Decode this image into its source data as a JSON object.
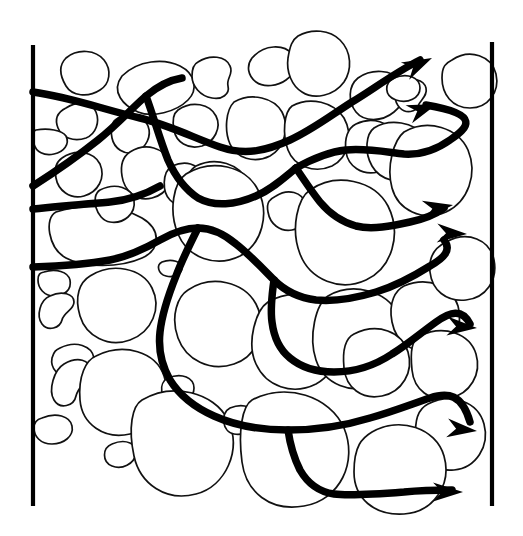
{
  "figure": {
    "domain": "Diagram",
    "canvas": {
      "width": 523,
      "height": 536,
      "background": "#ffffff"
    }
  },
  "style": {
    "grain_outline_color": "#111111",
    "grain_fill_color": "#ffffff",
    "flow_path_color": "#000000",
    "boundary_color": "#000000",
    "grain_stroke_width": 1.7,
    "flow_stroke_width": 7.5,
    "boundary_stroke_width": 4.2
  },
  "boundaries": [
    {
      "name": "inlet-boundary-left",
      "x1": 33,
      "y1": 45,
      "x2": 33,
      "y2": 506
    },
    {
      "name": "outlet-boundary-right",
      "x1": 492,
      "y1": 42,
      "x2": 492,
      "y2": 506
    }
  ],
  "flow": {
    "inlet_count": 4,
    "outlet_count": 7,
    "inlet_points": [
      {
        "label": "inlet-1",
        "x": 33,
        "y": 92
      },
      {
        "label": "inlet-2",
        "x": 33,
        "y": 186
      },
      {
        "label": "inlet-3",
        "x": 33,
        "y": 209
      },
      {
        "label": "inlet-4",
        "x": 33,
        "y": 267
      }
    ],
    "outlet_points": [
      {
        "label": "outlet-1",
        "x": 432,
        "y": 58
      },
      {
        "label": "outlet-2",
        "x": 436,
        "y": 104
      },
      {
        "label": "outlet-3",
        "x": 452,
        "y": 205
      },
      {
        "label": "outlet-4",
        "x": 466,
        "y": 234
      },
      {
        "label": "outlet-5",
        "x": 476,
        "y": 327
      },
      {
        "label": "outlet-6",
        "x": 476,
        "y": 430
      },
      {
        "label": "outlet-7",
        "x": 462,
        "y": 492
      }
    ],
    "paths": [
      {
        "name": "flow-path-1",
        "d": "M 33 92 C 70 97 105 110 140 118 C 172 126 196 139 220 147 C 246 156 268 150 290 140 C 312 130 330 116 352 102 C 372 90 396 72 420 60"
      },
      {
        "name": "flow-path-2",
        "d": "M 33 186 C 58 170 78 156 98 140 C 118 124 132 108 146 96 C 158 86 170 80 182 78"
      },
      {
        "name": "flow-path-3",
        "d": "M 146 96 C 154 118 160 140 168 160 C 176 178 186 190 198 198 C 214 207 236 205 256 196 C 272 189 284 178 296 168"
      },
      {
        "name": "flow-path-4",
        "d": "M 296 168 C 312 159 328 152 346 150 C 366 148 386 152 404 154 C 420 155 436 150 450 140 C 468 128 482 114 426 105"
      },
      {
        "name": "flow-path-5",
        "d": "M 296 168 C 304 180 312 192 320 202 C 330 214 342 222 356 226 C 372 230 392 226 410 222 C 424 219 436 214 444 208"
      },
      {
        "name": "flow-path-6",
        "d": "M 33 209 C 60 206 86 204 110 202 C 130 200 146 194 160 186"
      },
      {
        "name": "flow-path-7",
        "d": "M 33 267 C 62 266 88 264 110 260 C 130 256 146 248 160 240 C 174 232 186 228 198 228 C 212 228 224 234 236 244 C 250 255 262 268 274 280 C 286 292 300 298 316 300 C 336 302 356 298 376 292 C 396 286 414 276 430 266 C 444 258 452 250 444 240"
      },
      {
        "name": "flow-path-8",
        "d": "M 274 280 C 272 294 270 308 272 322 C 274 338 280 350 290 358 C 302 368 318 372 334 372 C 354 372 374 366 392 354 C 408 344 422 332 436 322 C 450 312 462 308 470 324"
      },
      {
        "name": "flow-path-9",
        "d": "M 198 228 C 190 244 182 260 176 276 C 168 296 162 314 160 332 C 158 350 162 366 170 380 C 180 396 196 408 214 416 C 236 426 262 430 288 430 C 316 430 344 426 370 418 C 392 412 412 404 430 398 C 448 392 462 394 470 422"
      },
      {
        "name": "flow-path-10",
        "d": "M 288 430 C 290 444 294 458 300 470 C 308 484 320 492 334 494 C 350 496 378 494 404 492 C 424 490 440 490 452 490"
      }
    ],
    "arrowheads": [
      {
        "name": "arrowhead-1",
        "tip_x": 432,
        "tip_y": 58,
        "angle": -26
      },
      {
        "name": "arrowhead-2",
        "tip_x": 437,
        "tip_y": 104,
        "angle": -20
      },
      {
        "name": "arrowhead-3",
        "tip_x": 453,
        "tip_y": 205,
        "angle": -10
      },
      {
        "name": "arrowhead-4",
        "tip_x": 467,
        "tip_y": 234,
        "angle": 2
      },
      {
        "name": "arrowhead-5",
        "tip_x": 477,
        "tip_y": 328,
        "angle": 4
      },
      {
        "name": "arrowhead-6",
        "tip_x": 477,
        "tip_y": 431,
        "angle": 6
      },
      {
        "name": "arrowhead-7",
        "tip_x": 463,
        "tip_y": 492,
        "angle": 0
      }
    ]
  },
  "grains": [
    {
      "name": "grain-1",
      "d": "M 66 58 C 78 48 96 50 104 60 C 112 70 110 84 100 90 C 88 98 72 96 66 86 C 60 76 58 66 66 58 Z"
    },
    {
      "name": "grain-2",
      "d": "M 122 76 C 138 60 164 58 180 66 C 196 74 198 90 188 100 C 176 112 152 118 138 112 C 124 106 110 92 122 76 Z"
    },
    {
      "name": "grain-3",
      "d": "M 198 62 C 210 54 226 56 230 66 C 234 74 226 78 228 86 C 230 94 222 100 212 98 C 200 96 192 86 192 76 C 192 68 194 64 198 62 Z"
    },
    {
      "name": "grain-4",
      "d": "M 252 58 C 264 44 284 44 292 54 C 300 64 294 74 286 80 C 278 86 264 88 256 82 C 248 76 246 66 252 58 Z"
    },
    {
      "name": "grain-5",
      "d": "M 298 36 C 312 28 330 30 340 40 C 352 52 352 70 344 82 C 334 96 314 100 302 92 C 292 86 286 72 288 58 C 290 46 292 40 298 36 Z"
    },
    {
      "name": "grain-6",
      "d": "M 358 78 C 372 68 392 70 400 80 C 408 90 404 104 394 112 C 382 122 364 122 356 112 C 348 102 348 86 358 78 Z"
    },
    {
      "name": "grain-7",
      "d": "M 400 82 C 412 76 424 80 426 88 C 428 96 420 100 418 106 C 416 112 406 114 400 108 C 394 102 392 88 400 82 Z"
    },
    {
      "name": "grain-8",
      "d": "M 66 108 C 78 100 92 102 96 112 C 100 122 96 134 86 138 C 74 142 62 138 58 128 C 54 118 58 112 66 108 Z"
    },
    {
      "name": "grain-9",
      "d": "M 36 130 C 48 128 62 130 66 136 C 70 144 64 152 54 154 C 44 156 36 152 34 144 C 32 136 32 131 36 130 Z"
    },
    {
      "name": "grain-10",
      "d": "M 118 118 C 130 112 144 116 148 126 C 152 136 146 148 136 152 C 124 156 114 148 112 138 C 110 128 112 121 118 118 Z"
    },
    {
      "name": "grain-11",
      "d": "M 178 110 C 192 100 210 104 216 116 C 222 128 214 142 202 146 C 188 150 176 142 174 130 C 172 120 174 113 178 110 Z"
    },
    {
      "name": "grain-12",
      "d": "M 234 102 C 252 92 274 98 282 112 C 290 128 284 148 270 156 C 254 164 236 158 230 144 C 224 130 226 110 234 102 Z"
    },
    {
      "name": "grain-13",
      "d": "M 292 106 C 310 96 334 102 344 118 C 354 136 348 158 332 166 C 314 174 294 166 288 150 C 282 134 284 112 292 106 Z"
    },
    {
      "name": "grain-14",
      "d": "M 356 124 C 372 116 390 122 396 136 C 402 152 394 168 378 172 C 362 176 348 166 346 152 C 344 138 348 128 356 124 Z"
    },
    {
      "name": "grain-15",
      "d": "M 374 128 C 390 118 414 122 424 136 C 434 150 430 168 416 176 C 400 186 380 180 372 166 C 364 152 366 134 374 128 Z"
    },
    {
      "name": "grain-16",
      "d": "M 62 158 C 76 148 94 152 100 164 C 106 178 98 192 84 196 C 70 200 58 190 56 178 C 54 168 56 162 62 158 Z"
    },
    {
      "name": "grain-17",
      "d": "M 130 152 C 146 142 164 148 170 162 C 176 178 168 194 152 198 C 136 202 124 190 122 176 C 120 164 124 156 130 152 Z"
    },
    {
      "name": "grain-18",
      "d": "M 172 166 C 186 160 198 164 200 174 C 202 184 194 190 192 198 C 190 206 178 208 170 200 C 162 192 162 172 172 166 Z"
    },
    {
      "name": "grain-19",
      "d": "M 196 166 C 216 156 240 164 248 182 C 256 202 248 224 230 232 C 210 240 190 230 184 212 C 178 194 186 172 196 166 Z"
    },
    {
      "name": "grain-20",
      "d": "M 276 196 C 288 188 302 192 306 204 C 310 216 304 228 292 230 C 280 232 270 224 268 212 C 266 202 270 199 276 196 Z"
    },
    {
      "name": "grain-21",
      "d": "M 186 174 C 212 158 246 166 258 190 C 270 214 262 244 240 256 C 216 268 188 258 178 234 C 168 210 174 182 186 174 Z"
    },
    {
      "name": "grain-22",
      "d": "M 310 190 C 336 172 374 180 388 206 C 402 234 392 268 366 280 C 340 292 310 280 300 254 C 290 228 298 198 310 190 Z"
    },
    {
      "name": "grain-23",
      "d": "M 404 132 C 428 118 458 128 468 150 C 478 174 468 202 446 212 C 422 222 398 210 392 188 C 386 166 394 140 404 132 Z"
    },
    {
      "name": "grain-24",
      "d": "M 56 212 C 84 202 122 206 142 218 C 162 230 160 250 142 258 C 120 268 84 268 66 258 C 48 248 44 218 56 212 Z"
    },
    {
      "name": "grain-25",
      "d": "M 162 262 C 172 258 182 262 182 268 C 182 274 174 278 166 276 C 158 274 156 265 162 262 Z"
    },
    {
      "name": "grain-26",
      "d": "M 90 276 C 112 262 142 268 152 288 C 162 308 152 332 130 340 C 108 348 86 336 80 316 C 74 296 80 282 90 276 Z"
    },
    {
      "name": "grain-27",
      "d": "M 44 272 C 56 268 68 272 70 280 C 72 290 64 296 54 296 C 44 296 38 288 38 280 C 38 274 40 273 44 272 Z"
    },
    {
      "name": "grain-28",
      "d": "M 188 290 C 212 274 244 282 256 304 C 268 328 258 356 234 364 C 210 372 186 360 178 338 C 170 316 178 296 188 290 Z"
    },
    {
      "name": "grain-29",
      "d": "M 268 302 C 292 288 322 294 334 316 C 346 340 338 372 316 384 C 292 396 266 386 256 364 C 246 342 256 310 268 302 Z"
    },
    {
      "name": "grain-30",
      "d": "M 328 296 C 352 282 386 290 398 314 C 410 340 400 372 376 384 C 352 396 324 384 316 360 C 308 336 316 304 328 296 Z"
    },
    {
      "name": "grain-31",
      "d": "M 404 286 C 428 276 452 286 458 306 C 464 326 452 346 432 350 C 412 354 396 342 392 322 C 388 302 396 290 404 286 Z"
    },
    {
      "name": "grain-32",
      "d": "M 446 242 C 468 230 490 240 494 260 C 498 280 486 298 466 300 C 446 302 432 290 430 272 C 428 254 438 246 446 242 Z"
    },
    {
      "name": "grain-33",
      "d": "M 50 296 C 62 290 74 294 74 302 C 74 310 64 312 62 320 C 60 328 48 332 42 324 C 36 316 40 300 50 296 Z"
    },
    {
      "name": "grain-34",
      "d": "M 60 348 C 76 340 92 346 94 358 C 96 370 86 378 72 378 C 58 378 50 368 52 358 C 54 351 56 350 60 348 Z"
    },
    {
      "name": "grain-35",
      "d": "M 64 364 C 78 356 90 360 90 370 C 90 380 78 386 76 396 C 74 406 60 410 54 400 C 48 390 54 370 64 364 Z"
    },
    {
      "name": "grain-36",
      "d": "M 96 356 C 124 342 156 352 164 376 C 172 400 156 428 130 434 C 104 440 82 424 80 400 C 78 376 86 360 96 356 Z"
    },
    {
      "name": "grain-37",
      "d": "M 42 418 C 56 412 70 416 72 426 C 74 436 64 444 52 444 C 40 444 34 436 34 428 C 34 421 38 419 42 418 Z"
    },
    {
      "name": "grain-38",
      "d": "M 168 378 C 182 372 194 378 194 388 C 194 398 184 404 172 402 C 160 400 158 383 168 378 Z"
    },
    {
      "name": "grain-39",
      "d": "M 112 444 C 126 438 138 444 136 454 C 134 464 122 470 112 466 C 102 462 102 448 112 444 Z"
    },
    {
      "name": "grain-40",
      "d": "M 142 400 C 172 382 214 392 228 420 C 242 450 226 486 196 494 C 166 502 140 484 134 456 C 128 428 132 406 142 400 Z"
    },
    {
      "name": "grain-41",
      "d": "M 230 408 C 244 402 256 408 256 418 C 256 428 246 436 234 434 C 222 432 220 413 230 408 Z"
    },
    {
      "name": "grain-42",
      "d": "M 252 400 C 286 382 330 396 344 428 C 358 462 340 500 304 506 C 270 512 246 492 242 462 C 238 432 242 406 252 400 Z"
    },
    {
      "name": "grain-43",
      "d": "M 354 334 C 378 322 402 332 408 352 C 414 372 402 392 382 396 C 362 400 346 388 344 368 C 342 348 346 338 354 334 Z"
    },
    {
      "name": "grain-44",
      "d": "M 420 336 C 444 324 470 334 476 354 C 482 374 470 394 450 398 C 430 402 414 390 412 370 C 410 350 412 340 420 336 Z"
    },
    {
      "name": "grain-45",
      "d": "M 428 404 C 452 392 478 402 484 424 C 490 446 476 468 454 470 C 432 472 418 458 416 438 C 414 418 420 408 428 404 Z"
    },
    {
      "name": "grain-46",
      "d": "M 372 432 C 400 416 436 428 444 456 C 452 484 434 512 404 514 C 374 516 354 498 354 472 C 354 446 362 438 372 432 Z"
    },
    {
      "name": "grain-47",
      "d": "M 100 190 C 116 182 132 188 134 200 C 136 214 124 224 110 222 C 96 220 90 196 100 190 Z"
    },
    {
      "name": "grain-48",
      "d": "M 452 60 C 470 48 492 56 496 74 C 500 92 488 108 470 108 C 452 108 442 94 442 78 C 442 66 446 63 452 60 Z"
    },
    {
      "name": "grain-49",
      "d": "M 394 78 C 408 72 420 78 420 88 C 420 98 408 104 396 100 C 384 96 384 83 394 78 Z"
    }
  ]
}
